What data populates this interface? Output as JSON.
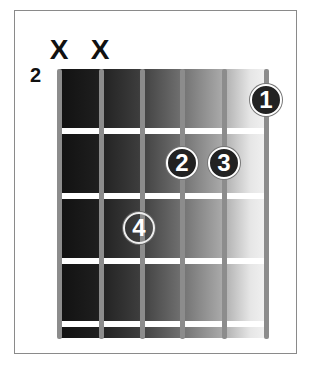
{
  "chord_diagram": {
    "starting_fret": "2",
    "strings": 6,
    "frets_shown": 4,
    "muted_strings": [
      {
        "string": 6,
        "symbol": "X"
      },
      {
        "string": 5,
        "symbol": "X"
      }
    ],
    "fingers": [
      {
        "label": "1",
        "string": 1,
        "fret": 1,
        "style": "filled"
      },
      {
        "label": "2",
        "string": 3,
        "fret": 2,
        "style": "filled"
      },
      {
        "label": "3",
        "string": 2,
        "fret": 2,
        "style": "filled"
      },
      {
        "label": "4",
        "string": 4,
        "fret": 3,
        "style": "hollow"
      }
    ]
  }
}
